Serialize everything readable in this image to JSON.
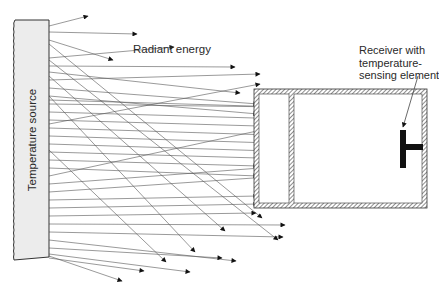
{
  "diagram": {
    "labels": {
      "source": "Temperature source",
      "radiant_energy": "Radiant energy",
      "receiver_line1": "Receiver with",
      "receiver_line2": "temperature-",
      "receiver_line3": "sensing element"
    },
    "colors": {
      "ray": "#555555",
      "source_fill": "#ececec",
      "outline": "#333333",
      "hatch": "#444444",
      "sensor": "#111111"
    },
    "source": {
      "x": 15,
      "y": 20,
      "width": 34,
      "height": 237
    },
    "enclosure": {
      "x": 254,
      "y": 89,
      "width": 173,
      "height": 119,
      "wall": 5,
      "divider_x": 289
    },
    "sensor": {
      "bar_x": 400,
      "bar_y": 130,
      "bar_w": 6,
      "bar_h": 38,
      "stem_y": 144,
      "stem_x2": 423,
      "stem_h": 6
    },
    "rays": [
      [
        49,
        26,
        88,
        16
      ],
      [
        49,
        32,
        137,
        34
      ],
      [
        49,
        40,
        113,
        60
      ],
      [
        49,
        58,
        174,
        47
      ],
      [
        49,
        66,
        235,
        67
      ],
      [
        49,
        72,
        240,
        93
      ],
      [
        49,
        80,
        260,
        74
      ],
      [
        49,
        88,
        258,
        104
      ],
      [
        49,
        96,
        258,
        114
      ],
      [
        49,
        104,
        286,
        107
      ],
      [
        49,
        112,
        392,
        122
      ],
      [
        49,
        120,
        398,
        130
      ],
      [
        49,
        128,
        398,
        139
      ],
      [
        49,
        136,
        398,
        147
      ],
      [
        49,
        144,
        398,
        155
      ],
      [
        49,
        152,
        398,
        162
      ],
      [
        49,
        160,
        258,
        166
      ],
      [
        49,
        168,
        258,
        176
      ],
      [
        49,
        176,
        280,
        126
      ],
      [
        49,
        184,
        300,
        165
      ],
      [
        49,
        192,
        312,
        174
      ],
      [
        49,
        200,
        258,
        196
      ],
      [
        49,
        208,
        258,
        204
      ],
      [
        49,
        216,
        256,
        213
      ],
      [
        49,
        224,
        285,
        225
      ],
      [
        49,
        232,
        283,
        237
      ],
      [
        49,
        240,
        236,
        261
      ],
      [
        49,
        248,
        222,
        258
      ],
      [
        49,
        254,
        190,
        272
      ],
      [
        49,
        258,
        144,
        271
      ],
      [
        49,
        256,
        122,
        281
      ],
      [
        49,
        44,
        262,
        218
      ],
      [
        49,
        60,
        278,
        240
      ],
      [
        49,
        76,
        225,
        231
      ],
      [
        49,
        96,
        195,
        252
      ],
      [
        49,
        150,
        166,
        262
      ],
      [
        49,
        100,
        318,
        108
      ],
      [
        49,
        124,
        260,
        84
      ]
    ]
  }
}
